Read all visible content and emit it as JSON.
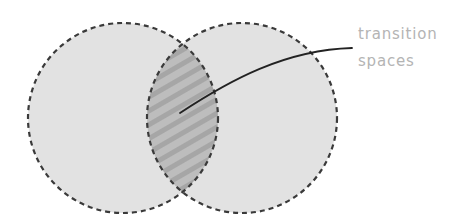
{
  "diagram": {
    "type": "venn",
    "sets": [
      {
        "id": "left",
        "cx": 123,
        "cy": 118,
        "r": 95
      },
      {
        "id": "right",
        "cx": 242,
        "cy": 118,
        "r": 95
      }
    ],
    "intersection": {
      "pattern": "diagonal-stripes"
    },
    "colors": {
      "circle_fill": "#e2e2e2",
      "circle_stroke": "#3a3a3a",
      "intersection_fill": "#bdbdbd",
      "stripe": "#a8a8a8",
      "leader_line": "#222222",
      "label_text": "#b4b4b4"
    },
    "annotation": {
      "line1": "transition",
      "line2": "spaces",
      "points_to": "intersection"
    }
  }
}
